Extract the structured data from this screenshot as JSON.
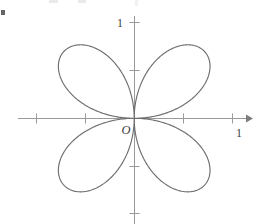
{
  "figure": {
    "title": "",
    "origin_label": "O",
    "bullet_marker": "•"
  },
  "chart_data": {
    "type": "line",
    "title": "",
    "subtitle": "",
    "xlabel": "",
    "ylabel": "",
    "curve_name": "four-petaled rose",
    "polar_equation": "r = sin(2θ)",
    "petal_count": 4,
    "max_radius": 1,
    "petal_tip_angles_deg": [
      45,
      135,
      225,
      315
    ],
    "xlim": [
      -1.37,
      1.22
    ],
    "ylim": [
      -1.0,
      1.0
    ],
    "grid": false,
    "legend": null,
    "axes": {
      "x_axis": {
        "label": "",
        "tick_values": [
          -1.0,
          -0.5,
          0.5,
          1.0
        ],
        "labeled_ticks": [
          {
            "value": 1,
            "text": "1"
          }
        ],
        "arrow": "right"
      },
      "y_axis": {
        "label": "",
        "tick_values": [
          -1.0,
          -0.5,
          0.5,
          1.0
        ],
        "labeled_ticks": [
          {
            "value": 1,
            "text": "1"
          }
        ],
        "arrow": "none"
      }
    },
    "series": [
      {
        "name": "r = sin(2θ)",
        "color": "#6e6e6e",
        "points_polar_deg": [
          {
            "theta": 0,
            "r": 0
          },
          {
            "theta": 15,
            "r": 0.5
          },
          {
            "theta": 30,
            "r": 0.866
          },
          {
            "theta": 45,
            "r": 1.0
          },
          {
            "theta": 60,
            "r": 0.866
          },
          {
            "theta": 75,
            "r": 0.5
          },
          {
            "theta": 90,
            "r": 0
          },
          {
            "theta": 105,
            "r": 0.5
          },
          {
            "theta": 120,
            "r": 0.866
          },
          {
            "theta": 135,
            "r": 1.0
          },
          {
            "theta": 150,
            "r": 0.866
          },
          {
            "theta": 165,
            "r": 0.5
          },
          {
            "theta": 180,
            "r": 0
          },
          {
            "theta": 195,
            "r": 0.5
          },
          {
            "theta": 210,
            "r": 0.866
          },
          {
            "theta": 225,
            "r": 1.0
          },
          {
            "theta": 240,
            "r": 0.866
          },
          {
            "theta": 255,
            "r": 0.5
          },
          {
            "theta": 270,
            "r": 0
          },
          {
            "theta": 285,
            "r": 0.5
          },
          {
            "theta": 300,
            "r": 0.866
          },
          {
            "theta": 315,
            "r": 1.0
          },
          {
            "theta": 330,
            "r": 0.866
          },
          {
            "theta": 345,
            "r": 0.5
          },
          {
            "theta": 360,
            "r": 0
          }
        ]
      }
    ],
    "colors": {
      "curve": "#6e6e6e",
      "axis": "#9a9a9a",
      "text": "#3d3d3d",
      "background": "#ffffff"
    }
  },
  "labels": {
    "x_one": "1",
    "y_one": "1",
    "origin": "O"
  }
}
